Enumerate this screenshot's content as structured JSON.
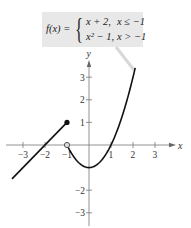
{
  "formula": {
    "lhs": "f(x) =",
    "case1_expr": "x + 2,",
    "case1_cond": "x ≤ −1",
    "case2_expr": "x² − 1,",
    "case2_cond": "x > −1"
  },
  "chart_data": {
    "type": "line",
    "xlabel": "x",
    "ylabel": "y",
    "xlim": [
      -3.8,
      3.8
    ],
    "ylim": [
      -3.5,
      3.8
    ],
    "grid": false,
    "x_ticks": [
      -3,
      -2,
      -1,
      1,
      2,
      3
    ],
    "x_tick_labels": [
      "−3",
      "−2",
      "−1",
      "1",
      "2",
      "3"
    ],
    "y_ticks": [
      -3,
      -2,
      1,
      2,
      3
    ],
    "y_tick_labels": [
      "−3",
      "−2",
      "1",
      "2",
      "3"
    ],
    "series": [
      {
        "name": "x + 2, x ≤ −1",
        "x": [
          -3.5,
          -1
        ],
        "y": [
          -1.5,
          1
        ],
        "endpoint": {
          "x": -1,
          "y": 1,
          "style": "closed"
        }
      },
      {
        "name": "x² − 1, x > −1",
        "x": [
          -1,
          -0.5,
          0,
          0.5,
          1,
          1.5,
          2.1
        ],
        "y": [
          0,
          -0.75,
          -1,
          -0.75,
          0,
          1.25,
          3.41
        ],
        "endpoint": {
          "x": -1,
          "y": 0,
          "style": "open"
        }
      }
    ],
    "annotations": [
      "f(x) = { x + 2, x ≤ −1 ; x² − 1, x > −1 }"
    ]
  },
  "axis": {
    "x_label": "x",
    "y_label": "y"
  }
}
